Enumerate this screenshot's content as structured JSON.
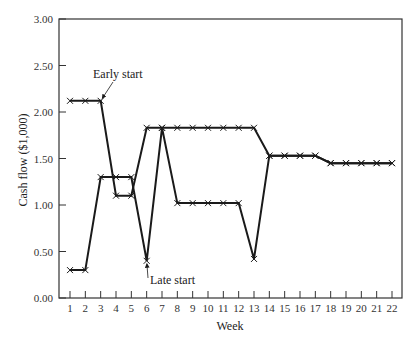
{
  "chart_data": {
    "type": "line",
    "title": "",
    "xlabel": "Week",
    "ylabel": "Cash flow ($1,000)",
    "x": [
      1,
      2,
      3,
      4,
      5,
      6,
      7,
      8,
      9,
      10,
      11,
      12,
      13,
      14,
      15,
      16,
      17,
      18,
      19,
      20,
      21,
      22
    ],
    "xlim": [
      1,
      22
    ],
    "ylim": [
      0,
      3.0
    ],
    "yticks": [
      "0.00",
      "0.50",
      "1.00",
      "1.50",
      "2.00",
      "2.50",
      "3.00"
    ],
    "xticks": [
      "1",
      "2",
      "3",
      "4",
      "5",
      "6",
      "7",
      "8",
      "9",
      "10",
      "11",
      "12",
      "13",
      "14",
      "15",
      "16",
      "17",
      "18",
      "19",
      "20",
      "21",
      "22"
    ],
    "grid": false,
    "legend": "none (annotated with arrows)",
    "series": [
      {
        "name": "Early start",
        "values": [
          2.12,
          2.12,
          2.12,
          1.1,
          1.1,
          1.83,
          1.83,
          1.83,
          1.83,
          1.83,
          1.83,
          1.83,
          1.83,
          1.53,
          1.53,
          1.53,
          1.53,
          1.45,
          1.45,
          1.45,
          1.45,
          1.45
        ]
      },
      {
        "name": "Late start",
        "values": [
          0.3,
          0.3,
          1.3,
          1.3,
          1.3,
          0.4,
          1.83,
          1.02,
          1.02,
          1.02,
          1.02,
          1.02,
          0.42,
          1.53,
          1.53,
          1.53,
          1.53,
          1.45,
          1.45,
          1.45,
          1.45,
          1.45
        ]
      }
    ],
    "annotations": [
      {
        "text": "Early start",
        "points_to": {
          "week": 3,
          "value": 2.12
        }
      },
      {
        "text": "Late start",
        "points_to": {
          "week": 6,
          "value": 0.4
        }
      }
    ]
  },
  "colors": {
    "line": "#1a1a1a",
    "axis": "#333333",
    "background": "#ffffff"
  }
}
